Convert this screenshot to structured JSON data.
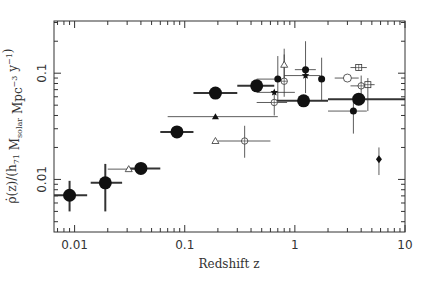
{
  "chart_data": {
    "type": "scatter",
    "title": "",
    "xlabel": "Redshift z",
    "ylabel": "ρ̇(z)/(h71 Msolar Mpc^-3 y^-1)",
    "xscale": "log",
    "yscale": "log",
    "xlim": [
      0.0065,
      10
    ],
    "ylim": [
      0.0032,
      0.31
    ],
    "x_ticks": [
      {
        "value": 0.01,
        "label": "0.01"
      },
      {
        "value": 0.1,
        "label": "0.1"
      },
      {
        "value": 1,
        "label": "1"
      },
      {
        "value": 10,
        "label": "10"
      }
    ],
    "y_ticks": [
      {
        "value": 0.01,
        "label": "0.01"
      },
      {
        "value": 0.1,
        "label": "0.1"
      }
    ],
    "grid": false,
    "legend": null,
    "series": [
      {
        "name": "large filled circles",
        "marker": "circle-filled-large",
        "points": [
          {
            "x": 0.009,
            "y": 0.0071,
            "xerr": [
              0.0065,
              0.013
            ],
            "yerr": [
              0.005,
              0.0097
            ]
          },
          {
            "x": 0.019,
            "y": 0.0093,
            "xerr": [
              0.014,
              0.027
            ],
            "yerr": [
              0.005,
              0.014
            ]
          },
          {
            "x": 0.04,
            "y": 0.0127,
            "xerr": [
              0.03,
              0.06
            ],
            "yerr": null
          },
          {
            "x": 0.085,
            "y": 0.028,
            "xerr": [
              0.06,
              0.12
            ],
            "yerr": null
          },
          {
            "x": 0.19,
            "y": 0.065,
            "xerr": [
              0.12,
              0.3
            ],
            "yerr": null
          },
          {
            "x": 0.45,
            "y": 0.076,
            "xerr": [
              0.3,
              0.65
            ],
            "yerr": null
          },
          {
            "x": 1.2,
            "y": 0.055,
            "xerr": [
              0.65,
              2.0
            ],
            "yerr": null
          },
          {
            "x": 3.8,
            "y": 0.057,
            "xerr": [
              2.0,
              10
            ],
            "yerr": null
          }
        ]
      },
      {
        "name": "small filled circles",
        "marker": "circle-filled-small",
        "points": [
          {
            "x": 0.7,
            "y": 0.088,
            "xerr": [
              0.45,
              0.75
            ],
            "yerr": [
              0.055,
              0.145
            ]
          },
          {
            "x": 1.25,
            "y": 0.108,
            "xerr": [
              1.0,
              1.55
            ],
            "yerr": [
              0.065,
              0.2
            ]
          },
          {
            "x": 1.75,
            "y": 0.088,
            "xerr": null,
            "yerr": [
              0.055,
              0.14
            ]
          },
          {
            "x": 3.4,
            "y": 0.044,
            "xerr": [
              2.0,
              4.5
            ],
            "yerr": [
              0.027,
              0.06
            ]
          }
        ]
      },
      {
        "name": "filled stars",
        "marker": "star-filled",
        "points": [
          {
            "x": 0.65,
            "y": 0.066,
            "xerr": [
              0.45,
              1.0
            ],
            "yerr": null
          },
          {
            "x": 1.25,
            "y": 0.095,
            "xerr": [
              0.8,
              1.7
            ],
            "yerr": null
          }
        ]
      },
      {
        "name": "filled triangle",
        "marker": "triangle-filled",
        "points": [
          {
            "x": 0.19,
            "y": 0.039,
            "xerr": [
              0.07,
              0.7
            ],
            "yerr": null
          }
        ]
      },
      {
        "name": "open triangles",
        "marker": "triangle-open",
        "points": [
          {
            "x": 0.031,
            "y": 0.0125,
            "xerr": [
              0.02,
              0.045
            ],
            "yerr": null
          },
          {
            "x": 0.19,
            "y": 0.023,
            "xerr": null,
            "yerr": null
          },
          {
            "x": 0.8,
            "y": 0.12,
            "xerr": null,
            "yerr": [
              0.085,
              0.17
            ]
          }
        ]
      },
      {
        "name": "open circles with cross",
        "marker": "circle-open-cross",
        "points": [
          {
            "x": 0.35,
            "y": 0.023,
            "xerr": [
              0.2,
              0.6
            ],
            "yerr": [
              0.016,
              0.032
            ]
          },
          {
            "x": 0.65,
            "y": 0.053,
            "xerr": [
              0.45,
              0.85
            ],
            "yerr": [
              0.04,
              0.069
            ]
          },
          {
            "x": 0.8,
            "y": 0.084,
            "xerr": null,
            "yerr": [
              0.06,
              0.15
            ]
          },
          {
            "x": 4.0,
            "y": 0.076,
            "xerr": [
              3.2,
              4.6
            ],
            "yerr": [
              0.06,
              0.095
            ]
          }
        ]
      },
      {
        "name": "open circle",
        "marker": "circle-open",
        "points": [
          {
            "x": 3.0,
            "y": 0.09,
            "xerr": [
              2.3,
              3.8
            ],
            "yerr": null
          }
        ]
      },
      {
        "name": "open squares with cross",
        "marker": "square-open-cross",
        "points": [
          {
            "x": 3.8,
            "y": 0.113,
            "xerr": [
              3.2,
              4.5
            ],
            "yerr": null
          },
          {
            "x": 4.6,
            "y": 0.078,
            "xerr": [
              3.8,
              5.3
            ],
            "yerr": [
              0.044,
              0.09
            ]
          }
        ]
      },
      {
        "name": "filled diamond",
        "marker": "diamond-filled",
        "points": [
          {
            "x": 5.8,
            "y": 0.0155,
            "xerr": null,
            "yerr": [
              0.011,
              0.02
            ]
          }
        ]
      }
    ]
  }
}
